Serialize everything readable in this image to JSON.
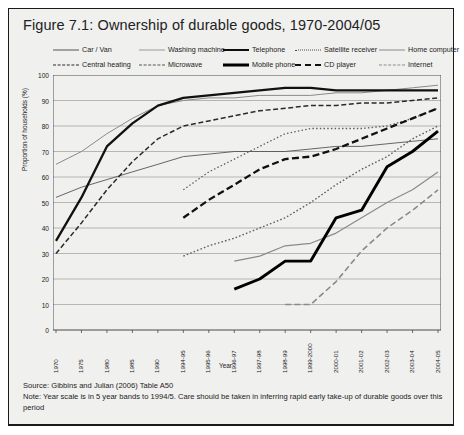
{
  "figure": {
    "title": "Figure 7.1: Ownership of durable goods, 1970-2004/05",
    "source": "Source: Gibbins and Julian (2006) Table A50",
    "note": "Note: Year scale is in 5 year bands to 1994/5. Care should be taken in inferring rapid early take-up of durable goods over this period"
  },
  "chart_data": {
    "type": "line",
    "title": "Figure 7.1: Ownership of durable goods, 1970-2004/05",
    "xlabel": "Year",
    "ylabel": "Proportion of households (%)",
    "ylim": [
      0,
      100
    ],
    "ytick_step": 10,
    "grid": true,
    "legend_position": "top",
    "categories": [
      "1970",
      "1975",
      "1980",
      "1985",
      "1990",
      "1994-95",
      "1995-96",
      "1996-97",
      "1997-98",
      "1998-99",
      "1999-2000",
      "2000-01",
      "2001-02",
      "2002-03",
      "2003-04",
      "2004-05"
    ],
    "yticks": [
      "0",
      "10",
      "20",
      "30",
      "40",
      "50",
      "60",
      "70",
      "80",
      "90",
      "100"
    ],
    "series": [
      {
        "name": "Car / Van",
        "style": "solid-thin",
        "color": "#555555",
        "values": [
          52,
          56,
          59,
          62,
          65,
          68,
          69,
          70,
          70,
          70,
          71,
          72,
          72,
          73,
          74,
          75
        ]
      },
      {
        "name": "Washing machine",
        "style": "solid-thin-grey",
        "color": "#8a8a8a",
        "values": [
          65,
          70,
          77,
          83,
          88,
          90,
          91,
          91,
          92,
          92,
          92,
          93,
          93,
          94,
          95,
          96
        ]
      },
      {
        "name": "Telephone",
        "style": "solid-thick",
        "color": "#111111",
        "values": [
          35,
          52,
          72,
          81,
          88,
          91,
          92,
          93,
          94,
          95,
          95,
          94,
          94,
          94,
          94,
          94
        ]
      },
      {
        "name": "Satellite receiver",
        "style": "dotted",
        "color": "#5f5f5f",
        "values": [
          null,
          null,
          null,
          null,
          null,
          null,
          null,
          null,
          null,
          null,
          null,
          null,
          null,
          null,
          null,
          null
        ]
      },
      {
        "name": "Home computer",
        "style": "solid-thin-grey2",
        "color": "#8a8a8a",
        "values": [
          null,
          null,
          null,
          null,
          null,
          null,
          null,
          27,
          29,
          33,
          34,
          38,
          44,
          50,
          55,
          62
        ]
      },
      {
        "name": "Central heating",
        "style": "dashed-med",
        "color": "#2a2a2a",
        "values": [
          30,
          42,
          55,
          66,
          75,
          80,
          82,
          84,
          86,
          87,
          88,
          88,
          89,
          89,
          90,
          91
        ]
      },
      {
        "name": "Microwave",
        "style": "dotted-fine",
        "color": "#5f5f5f",
        "values": [
          null,
          null,
          null,
          null,
          null,
          55,
          62,
          67,
          72,
          77,
          79,
          79,
          79,
          80,
          83,
          87
        ]
      },
      {
        "name": "Mobile phone",
        "style": "solid-extra-thick",
        "color": "#000000",
        "values": [
          null,
          null,
          null,
          null,
          null,
          null,
          null,
          16,
          20,
          27,
          27,
          44,
          47,
          64,
          70,
          78
        ]
      },
      {
        "name": "CD player",
        "style": "dashed-long",
        "color": "#111111",
        "values": [
          null,
          null,
          null,
          null,
          null,
          44,
          51,
          57,
          63,
          67,
          68,
          71,
          75,
          79,
          83,
          87
        ]
      },
      {
        "name": "Internet",
        "style": "dashed-grey",
        "color": "#8a8a8a",
        "values": [
          null,
          null,
          null,
          null,
          null,
          null,
          null,
          null,
          null,
          10,
          10,
          19,
          31,
          40,
          47,
          55
        ]
      }
    ]
  }
}
